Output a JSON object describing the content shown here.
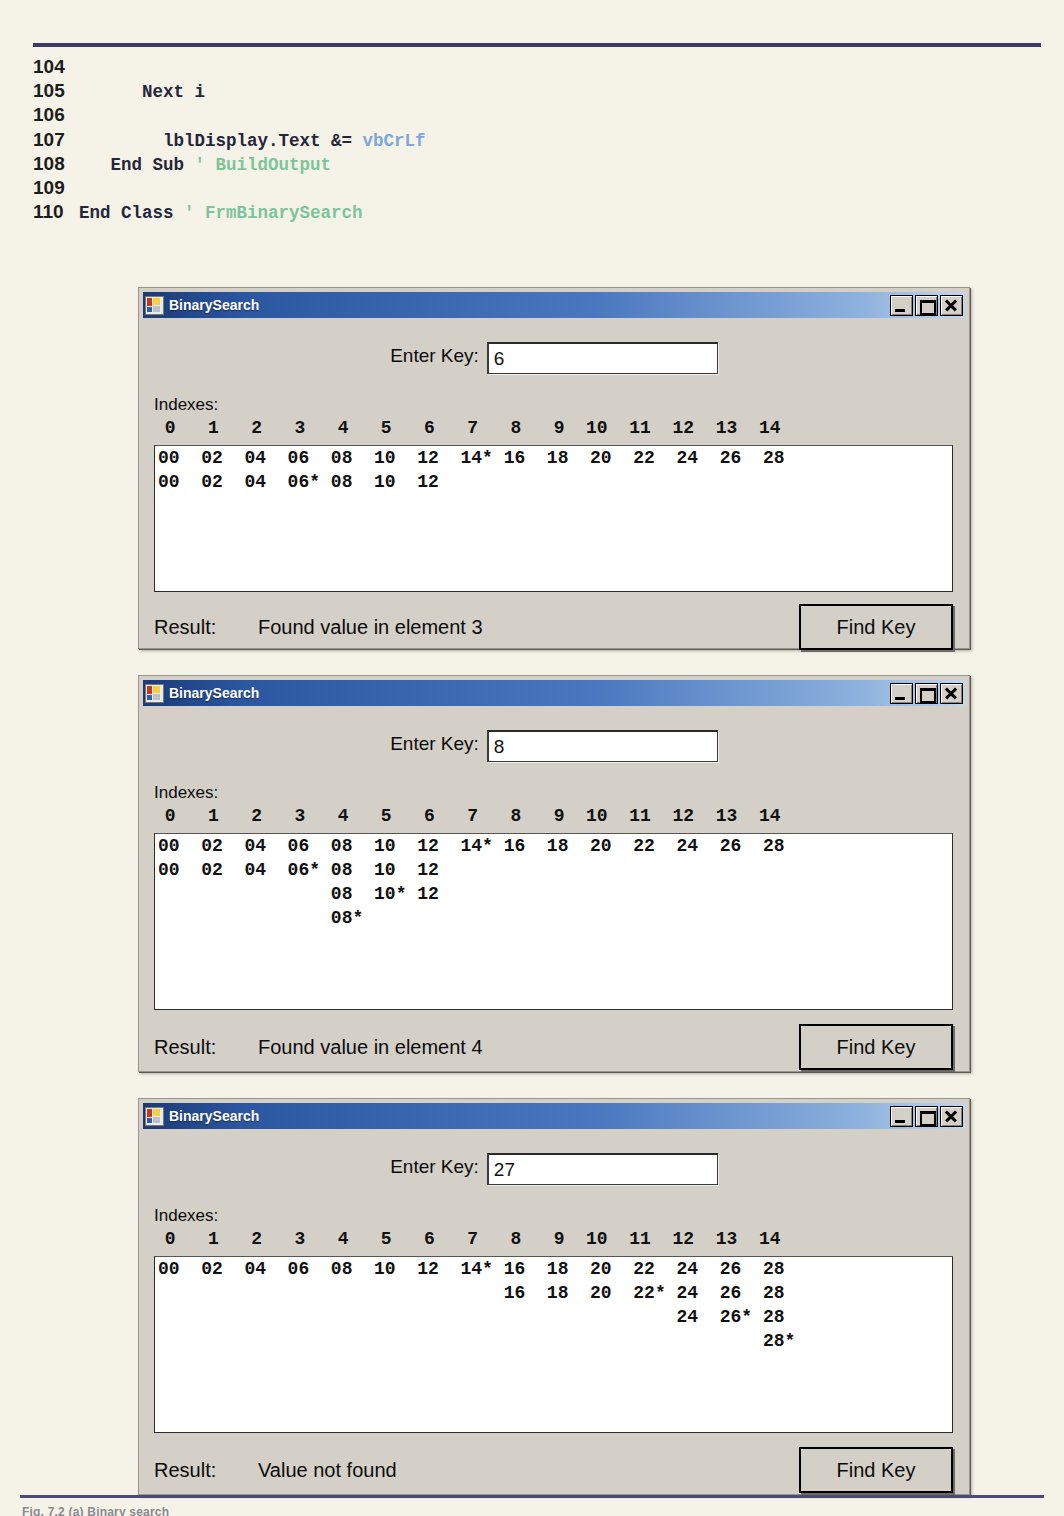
{
  "code_listing": {
    "lines": [
      {
        "num": "104",
        "segments": []
      },
      {
        "num": "105",
        "segments": [
          {
            "t": "      Next i",
            "c": "kw"
          }
        ]
      },
      {
        "num": "106",
        "segments": []
      },
      {
        "num": "107",
        "segments": [
          {
            "t": "        lblDisplay.Text &= ",
            "c": "kw"
          },
          {
            "t": "vbCrLf",
            "c": "lit"
          }
        ]
      },
      {
        "num": "108",
        "segments": [
          {
            "t": "   End Sub ",
            "c": "kw"
          },
          {
            "t": "' BuildOutput",
            "c": "cmt"
          }
        ]
      },
      {
        "num": "109",
        "segments": []
      },
      {
        "num": "110",
        "segments": [
          {
            "t": "End Class ",
            "c": "kw"
          },
          {
            "t": "' FrmBinarySearch",
            "c": "cmt"
          }
        ]
      }
    ]
  },
  "caption_sliver": "Fig. 7.2 (a) Binary search",
  "common": {
    "window_title": "BinarySearch",
    "app_icon": "binary-search-app-icon",
    "minimize_icon": "minimize-icon",
    "maximize_icon": "maximize-icon",
    "close_icon": "close-icon",
    "enter_key_label": "Enter Key:",
    "indexes_label": "Indexes:",
    "index_header": " 0   1   2   3   4   5   6   7   8   9  10  11  12  13  14",
    "result_label": "Result:",
    "find_key_label": "Find Key",
    "title_gradient_start": "#1b3a77",
    "title_gradient_end": "#c3d6ef",
    "face_color": "#d4d0c8",
    "listbox_color": "#ffffff",
    "page_color": "#f5f3e7",
    "rule_color": "#3b3a63"
  },
  "windows": [
    {
      "id": "window-1",
      "key_value": "6",
      "rows": [
        "00  02  04  06  08  10  12  14* 16  18  20  22  24  26  28",
        "00  02  04  06* 08  10  12"
      ],
      "result_text": "Found value in element 3"
    },
    {
      "id": "window-2",
      "key_value": "8",
      "rows": [
        "00  02  04  06  08  10  12  14* 16  18  20  22  24  26  28",
        "00  02  04  06* 08  10  12",
        "                08  10* 12",
        "                08*"
      ],
      "result_text": "Found value in element 4"
    },
    {
      "id": "window-3",
      "key_value": "27",
      "rows": [
        "00  02  04  06  08  10  12  14* 16  18  20  22  24  26  28",
        "                                16  18  20  22* 24  26  28",
        "                                                24  26* 28",
        "                                                        28*"
      ],
      "result_text": "Value not found"
    }
  ]
}
